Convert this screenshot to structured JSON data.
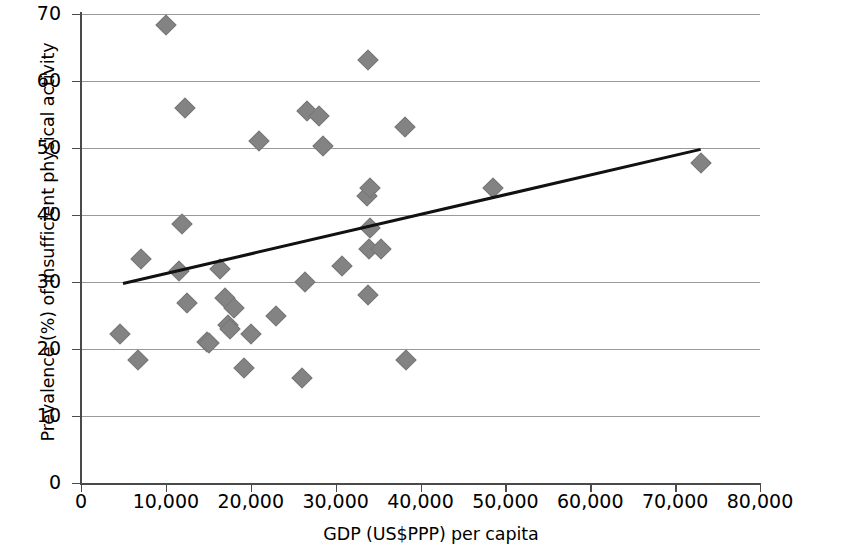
{
  "chart_data": {
    "type": "scatter",
    "title": "",
    "xlabel": "GDP (US$PPP) per capita",
    "ylabel": "Prevalence (%) of insufficient physical activity",
    "xlim": [
      0,
      80000
    ],
    "ylim": [
      0,
      70
    ],
    "grid": true,
    "legend": null,
    "x_ticks": [
      "0",
      "10,000",
      "20,000",
      "30,000",
      "40,000",
      "50,000",
      "60,000",
      "70,000",
      "80,000"
    ],
    "x_tick_values": [
      0,
      10000,
      20000,
      30000,
      40000,
      50000,
      60000,
      70000,
      80000
    ],
    "y_ticks": [
      "0",
      "10",
      "20",
      "30",
      "40",
      "50",
      "60",
      "70"
    ],
    "y_tick_values": [
      0,
      10,
      20,
      30,
      40,
      50,
      60,
      70
    ],
    "marker_color": "#838383",
    "marker_shape": "diamond",
    "trendline_color": "#111111",
    "points": [
      {
        "x": 4600,
        "y": 22.2
      },
      {
        "x": 6700,
        "y": 18.4
      },
      {
        "x": 7100,
        "y": 33.5
      },
      {
        "x": 10000,
        "y": 68.4
      },
      {
        "x": 11600,
        "y": 31.6
      },
      {
        "x": 11900,
        "y": 38.7
      },
      {
        "x": 12200,
        "y": 56.0
      },
      {
        "x": 12500,
        "y": 26.8
      },
      {
        "x": 14800,
        "y": 21.0
      },
      {
        "x": 15100,
        "y": 20.9
      },
      {
        "x": 16400,
        "y": 32.0
      },
      {
        "x": 17000,
        "y": 27.6
      },
      {
        "x": 17300,
        "y": 23.6
      },
      {
        "x": 17600,
        "y": 23.0
      },
      {
        "x": 18000,
        "y": 26.1
      },
      {
        "x": 19200,
        "y": 17.2
      },
      {
        "x": 20000,
        "y": 22.3
      },
      {
        "x": 21000,
        "y": 51.0
      },
      {
        "x": 23000,
        "y": 25.0
      },
      {
        "x": 26000,
        "y": 15.6
      },
      {
        "x": 26400,
        "y": 30.0
      },
      {
        "x": 26600,
        "y": 55.5
      },
      {
        "x": 28000,
        "y": 54.8
      },
      {
        "x": 28500,
        "y": 50.3
      },
      {
        "x": 30800,
        "y": 32.4
      },
      {
        "x": 33800,
        "y": 63.2
      },
      {
        "x": 33700,
        "y": 42.9
      },
      {
        "x": 34100,
        "y": 44.1
      },
      {
        "x": 34000,
        "y": 38.0
      },
      {
        "x": 33900,
        "y": 35.0
      },
      {
        "x": 33800,
        "y": 28.0
      },
      {
        "x": 35300,
        "y": 34.9
      },
      {
        "x": 38200,
        "y": 53.1
      },
      {
        "x": 38300,
        "y": 18.3
      },
      {
        "x": 48500,
        "y": 44.1
      },
      {
        "x": 73000,
        "y": 47.8
      }
    ],
    "trendline": {
      "x1": 5000,
      "y1": 30.0,
      "x2": 73000,
      "y2": 50.0
    }
  }
}
